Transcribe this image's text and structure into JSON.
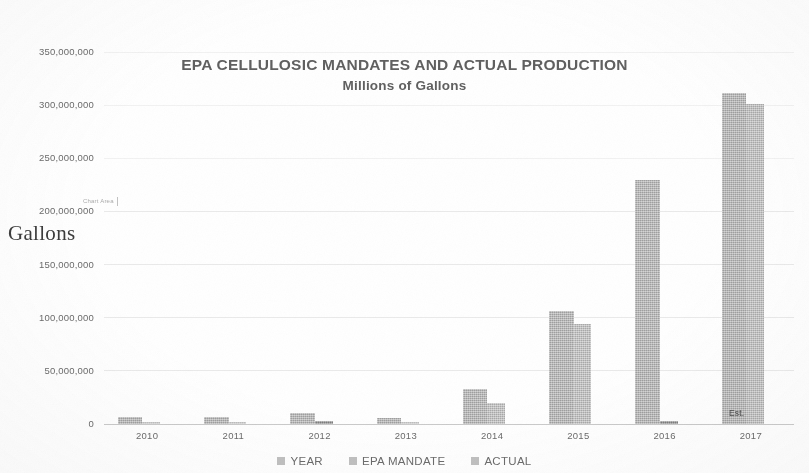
{
  "chart_data": {
    "type": "bar",
    "title": "EPA CELLULOSIC MANDATES AND ACTUAL PRODUCTION",
    "subtitle": "Millions of Gallons",
    "xlabel": "",
    "ylabel": "Gallons",
    "ylim": [
      0,
      350000000
    ],
    "grid": true,
    "legend_position": "bottom",
    "categories": [
      "2010",
      "2011",
      "2012",
      "2013",
      "2014",
      "2015",
      "2016",
      "2017"
    ],
    "series": [
      {
        "name": "YEAR",
        "values": [
          2010,
          2011,
          2012,
          2013,
          2014,
          2015,
          2016,
          2017
        ]
      },
      {
        "name": "EPA MANDATE",
        "values": [
          6500000,
          6600000,
          10450000,
          6000000,
          33000000,
          106000000,
          230000000,
          311000000
        ]
      },
      {
        "name": "ACTUAL",
        "values": [
          0,
          0,
          20000,
          0,
          20000000,
          94000000,
          3000000,
          301000000
        ]
      }
    ],
    "yticks": [
      "0",
      "50,000,000",
      "100,000,000",
      "150,000,000",
      "200,000,000",
      "250,000,000",
      "300,000,000",
      "350,000,000"
    ],
    "annotations": [
      {
        "text": "Est.",
        "category": "2017",
        "note": "label inside 2017 bar near baseline"
      },
      {
        "text": "Gallons",
        "note": "handwritten-style axis annotation over y-axis"
      },
      {
        "text": "Chart Area",
        "note": "faint Excel tooltip artifact near 200,000,000"
      }
    ],
    "colors": {
      "year": "#bfbfbf",
      "mandate": "#b0b0b0",
      "actual": "#bcbcbc",
      "actual_dark": "#8b8b8b",
      "gridline": "#d8d8d8",
      "text": "#6a6a6a"
    }
  },
  "legend": {
    "items": [
      {
        "label": "YEAR"
      },
      {
        "label": "EPA MANDATE"
      },
      {
        "label": "ACTUAL"
      }
    ]
  }
}
